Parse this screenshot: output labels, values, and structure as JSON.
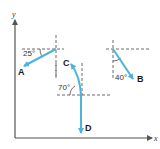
{
  "axes": {
    "x_label": "x",
    "y_label": "y"
  },
  "vectors": [
    {
      "name": "A",
      "label": "A",
      "angle_label": "25°",
      "direction": "down-left, 25° below horizontal"
    },
    {
      "name": "B",
      "label": "B",
      "angle_label": "40°",
      "direction": "down-right, 40° from vertical"
    },
    {
      "name": "C",
      "label": "C",
      "angle_label": "70°",
      "direction": "up-left, 70° from horizontal"
    },
    {
      "name": "D",
      "label": "D",
      "angle_label": "",
      "direction": "straight down"
    }
  ],
  "colors": {
    "vector": "#4fb3d9",
    "axis": "#555555",
    "dashed": "#444444",
    "text": "#1a1a1a"
  }
}
